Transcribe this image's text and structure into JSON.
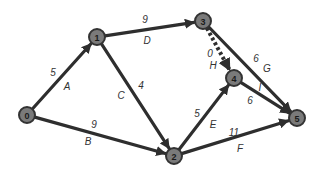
{
  "diagram": {
    "type": "network-graph",
    "colors": {
      "edge": "#2e2e2e",
      "node_fill": "#7a7a7a",
      "node_stroke": "#333333",
      "label": "#333333",
      "background": "#ffffff"
    },
    "nodes": [
      {
        "id": "0",
        "label": "0",
        "x": 27,
        "y": 115
      },
      {
        "id": "1",
        "label": "1",
        "x": 97,
        "y": 37
      },
      {
        "id": "2",
        "label": "2",
        "x": 174,
        "y": 156
      },
      {
        "id": "3",
        "label": "3",
        "x": 203,
        "y": 21
      },
      {
        "id": "4",
        "label": "4",
        "x": 234,
        "y": 78
      },
      {
        "id": "5",
        "label": "5",
        "x": 297,
        "y": 118
      }
    ],
    "edges": [
      {
        "from": "0",
        "to": "1",
        "activity": "A",
        "weight": "5",
        "style": "solid",
        "weight_pos": [
          53,
          72
        ],
        "activity_pos": [
          67,
          86
        ]
      },
      {
        "from": "0",
        "to": "2",
        "activity": "B",
        "weight": "9",
        "style": "solid",
        "weight_pos": [
          94,
          124
        ],
        "activity_pos": [
          88,
          141
        ]
      },
      {
        "from": "1",
        "to": "2",
        "activity": "C",
        "weight": "4",
        "style": "solid",
        "weight_pos": [
          141,
          85
        ],
        "activity_pos": [
          121,
          95
        ]
      },
      {
        "from": "1",
        "to": "3",
        "activity": "D",
        "weight": "9",
        "style": "solid",
        "weight_pos": [
          145,
          19
        ],
        "activity_pos": [
          147,
          40
        ]
      },
      {
        "from": "2",
        "to": "4",
        "activity": "E",
        "weight": "5",
        "style": "solid",
        "weight_pos": [
          197,
          113
        ],
        "activity_pos": [
          213,
          124
        ]
      },
      {
        "from": "2",
        "to": "5",
        "activity": "F",
        "weight": "11",
        "style": "solid",
        "weight_pos": [
          234,
          132
        ],
        "activity_pos": [
          240,
          148
        ]
      },
      {
        "from": "3",
        "to": "5",
        "activity": "G",
        "weight": "6",
        "style": "solid",
        "weight_pos": [
          256,
          58
        ],
        "activity_pos": [
          267,
          68
        ]
      },
      {
        "from": "3",
        "to": "4",
        "activity": "H",
        "weight": "0",
        "style": "dummy",
        "weight_pos": [
          210,
          53
        ],
        "activity_pos": [
          213,
          65
        ]
      },
      {
        "from": "4",
        "to": "5",
        "activity": "I",
        "weight": "6",
        "style": "solid",
        "weight_pos": [
          250,
          100
        ],
        "activity_pos": [
          260,
          87
        ]
      }
    ]
  }
}
